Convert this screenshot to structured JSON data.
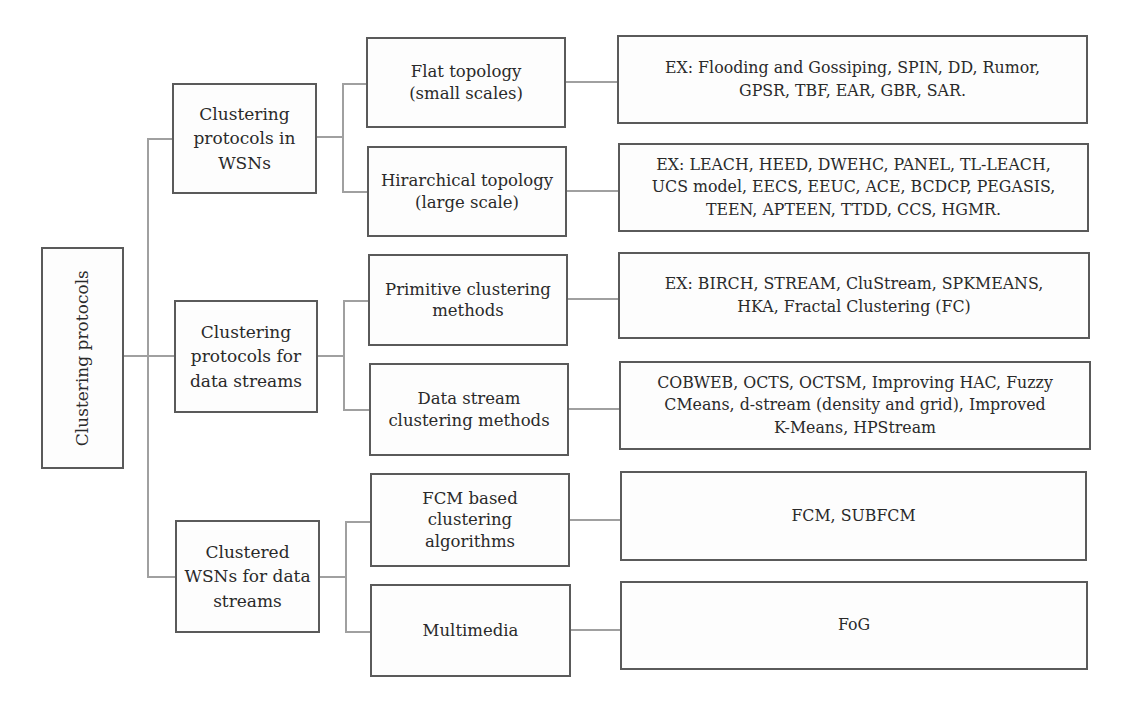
{
  "diagram": {
    "type": "hierarchy-tree",
    "root": {
      "label": "Clustering protocols"
    },
    "branches": [
      {
        "label": "Clustering\nprotocols in\nWSNs",
        "children": [
          {
            "label": "Flat topology\n(small scales)",
            "examples": "EX: Flooding and Gossiping, SPIN, DD, Rumor,\nGPSR, TBF, EAR, GBR, SAR."
          },
          {
            "label": "Hirarchical topology\n(large scale)",
            "examples": "EX: LEACH, HEED, DWEHC, PANEL, TL-LEACH,\nUCS model, EECS, EEUC, ACE, BCDCP, PEGASIS,\nTEEN, APTEEN, TTDD, CCS, HGMR."
          }
        ]
      },
      {
        "label": "Clustering\nprotocols for\ndata streams",
        "children": [
          {
            "label": "Primitive clustering\nmethods",
            "examples": "EX: BIRCH, STREAM, CluStream, SPKMEANS,\nHKA, Fractal Clustering (FC)"
          },
          {
            "label": "Data stream\nclustering methods",
            "examples": "COBWEB, OCTS, OCTSM, Improving HAC, Fuzzy\nCMeans, d-stream (density and grid), Improved\nK-Means, HPStream"
          }
        ]
      },
      {
        "label": "Clustered\nWSNs for data\nstreams",
        "children": [
          {
            "label": "FCM based\nclustering\nalgorithms",
            "examples": "FCM, SUBFCM"
          },
          {
            "label": "Multimedia",
            "examples": "FoG"
          }
        ]
      }
    ]
  },
  "colors": {
    "box_border": "#5a5a5a",
    "connector": "#a0a0a0",
    "text": "#2a2a2a",
    "background": "#ffffff"
  }
}
